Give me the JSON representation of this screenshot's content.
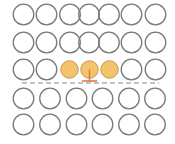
{
  "diagram": {
    "title": "",
    "colors": {
      "background": "#ffffff",
      "circle_stroke": "#7a7a7a",
      "circle_fill": "#ffffff",
      "highlight_fill": "#f2c46e",
      "highlight_stroke": "#c9954a",
      "connector": "#e2783a",
      "dashed_line": "#9fb4c9"
    },
    "circle_radius": 10.3,
    "rows": [
      {
        "name": "row-1",
        "cy": 14.5,
        "circles": [
          {
            "cx": 23.5,
            "highlighted": false
          },
          {
            "cx": 46.5,
            "highlighted": false
          },
          {
            "cx": 70,
            "highlighted": false
          },
          {
            "cx": 89,
            "highlighted": false
          },
          {
            "cx": 109,
            "highlighted": false
          },
          {
            "cx": 131.5,
            "highlighted": false
          },
          {
            "cx": 155.5,
            "highlighted": false
          }
        ]
      },
      {
        "name": "row-2",
        "cy": 42.5,
        "circles": [
          {
            "cx": 23.5,
            "highlighted": false
          },
          {
            "cx": 46.5,
            "highlighted": false
          },
          {
            "cx": 70,
            "highlighted": false
          },
          {
            "cx": 89,
            "highlighted": false
          },
          {
            "cx": 109,
            "highlighted": false
          },
          {
            "cx": 131.5,
            "highlighted": false
          },
          {
            "cx": 155.5,
            "highlighted": false
          }
        ]
      },
      {
        "name": "row-3",
        "cy": 69.5,
        "circles": [
          {
            "cx": 23.5,
            "highlighted": false
          },
          {
            "cx": 46.5,
            "highlighted": false
          },
          {
            "cx": 69.5,
            "highlighted": true,
            "r": 8.7
          },
          {
            "cx": 89.5,
            "highlighted": true,
            "r": 8.7,
            "has_stem": true
          },
          {
            "cx": 109.5,
            "highlighted": true,
            "r": 8.7
          },
          {
            "cx": 131.5,
            "highlighted": false
          },
          {
            "cx": 155.5,
            "highlighted": false
          }
        ]
      },
      {
        "name": "row-4",
        "cy": 98.5,
        "circles": [
          {
            "cx": 23.5,
            "highlighted": false
          },
          {
            "cx": 50,
            "highlighted": false
          },
          {
            "cx": 76.5,
            "highlighted": false
          },
          {
            "cx": 102.5,
            "highlighted": false
          },
          {
            "cx": 129,
            "highlighted": false
          },
          {
            "cx": 155,
            "highlighted": false
          }
        ]
      },
      {
        "name": "row-5",
        "cy": 124.5,
        "circles": [
          {
            "cx": 23.5,
            "highlighted": false
          },
          {
            "cx": 50,
            "highlighted": false
          },
          {
            "cx": 76.5,
            "highlighted": false
          },
          {
            "cx": 102.5,
            "highlighted": false
          },
          {
            "cx": 129,
            "highlighted": false
          },
          {
            "cx": 155,
            "highlighted": false
          }
        ]
      }
    ],
    "connector": {
      "stem_x": 89.5,
      "stem_y1": 69.5,
      "stem_y2": 81,
      "bar_x1": 82,
      "bar_x2": 97,
      "bar_y": 81
    },
    "dashed_line": {
      "x1": 22,
      "x2": 159,
      "y": 83,
      "dash": "5 3"
    }
  }
}
